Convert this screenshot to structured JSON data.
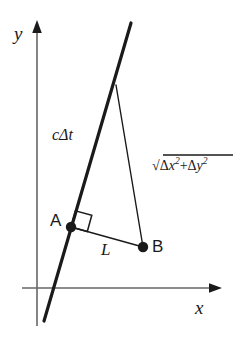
{
  "figure": {
    "background_color": "#ffffff",
    "stroke_color": "#1a1a1a",
    "axis_color": "#555555"
  },
  "axes": {
    "y_label": "y",
    "x_label": "x",
    "y_axis_name": "y-axis",
    "x_axis_name": "x-axis"
  },
  "labels": {
    "c_delta_t": "cΔt",
    "segment_L": "L",
    "point_A": "A",
    "point_B": "B",
    "hypotenuse": {
      "radical_sign": "√",
      "term1_delta": "Δ",
      "term1_var": "x",
      "term1_exp": "2",
      "operator": "+",
      "term2_delta": "Δ",
      "term2_var": "y",
      "term2_exp": "2",
      "full_text": "√(Δx² + Δy²)"
    }
  },
  "geometry": {
    "origin": {
      "x": 37,
      "y": 288
    },
    "y_axis": {
      "x": 37,
      "top_y": 22,
      "bottom_y": 326
    },
    "x_axis": {
      "y": 288,
      "left_x": 22,
      "right_x": 221
    },
    "thick_line": {
      "x1": 131,
      "y1": 23,
      "x2": 44,
      "y2": 321,
      "width": 3
    },
    "thin_line": {
      "x1": 116,
      "y1": 85,
      "x2": 143,
      "y2": 247,
      "width": 1.3
    },
    "segment_AB": {
      "x1": 71,
      "y1": 227,
      "x2": 143,
      "y2": 247,
      "width": 1.3
    },
    "point_A_dot": {
      "x": 71,
      "y": 227,
      "r": 5
    },
    "point_B_dot": {
      "x": 143,
      "y": 247,
      "r": 5
    },
    "right_angle_marker": {
      "size": 17
    }
  }
}
